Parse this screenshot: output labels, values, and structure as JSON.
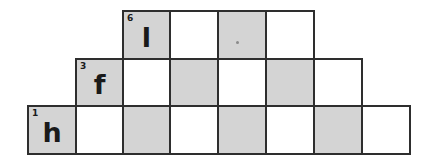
{
  "puzzle": {
    "type": "staircase-word-grid",
    "colors": {
      "shaded": "#d4d4d4",
      "empty": "#ffffff",
      "border": "#2e2e2e",
      "text": "#1a1a1a"
    },
    "rows": [
      {
        "row": 1,
        "start_col": 3,
        "cells": [
          {
            "shaded": true,
            "number": "6",
            "letter": "l"
          },
          {
            "shaded": false,
            "number": "",
            "letter": ""
          },
          {
            "shaded": true,
            "number": "",
            "letter": "",
            "mark": "dot"
          },
          {
            "shaded": false,
            "number": "",
            "letter": ""
          }
        ]
      },
      {
        "row": 2,
        "start_col": 2,
        "cells": [
          {
            "shaded": true,
            "number": "3",
            "letter": "f"
          },
          {
            "shaded": false,
            "number": "",
            "letter": ""
          },
          {
            "shaded": true,
            "number": "",
            "letter": ""
          },
          {
            "shaded": false,
            "number": "",
            "letter": ""
          },
          {
            "shaded": true,
            "number": "",
            "letter": ""
          },
          {
            "shaded": false,
            "number": "",
            "letter": ""
          }
        ]
      },
      {
        "row": 3,
        "start_col": 1,
        "cells": [
          {
            "shaded": true,
            "number": "1",
            "letter": "h"
          },
          {
            "shaded": false,
            "number": "",
            "letter": ""
          },
          {
            "shaded": true,
            "number": "",
            "letter": ""
          },
          {
            "shaded": false,
            "number": "",
            "letter": ""
          },
          {
            "shaded": true,
            "number": "",
            "letter": ""
          },
          {
            "shaded": false,
            "number": "",
            "letter": ""
          },
          {
            "shaded": true,
            "number": "",
            "letter": ""
          },
          {
            "shaded": false,
            "number": "",
            "letter": ""
          }
        ]
      }
    ]
  }
}
